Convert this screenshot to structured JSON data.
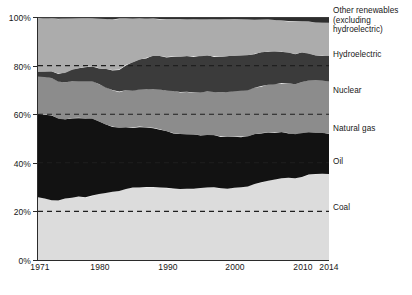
{
  "chart_data": {
    "type": "area",
    "title": "",
    "subtitle": "",
    "xlabel": "",
    "ylabel": "",
    "stacked": true,
    "normalized": true,
    "grid": true,
    "grid_style": "dashed-horizontal",
    "legend_position": "right",
    "xlim": [
      1971,
      2014
    ],
    "ylim": [
      0,
      100
    ],
    "y_ticks": [
      "0%",
      "20%",
      "40%",
      "60%",
      "80%",
      "100%"
    ],
    "y_tick_values": [
      0,
      20,
      40,
      60,
      80,
      100
    ],
    "x_ticks": [
      "1971",
      "1980",
      "1990",
      "2000",
      "2010",
      "2014"
    ],
    "x_tick_values": [
      1971,
      1980,
      1990,
      2000,
      2010,
      2014
    ],
    "x": [
      1971,
      1972,
      1973,
      1974,
      1975,
      1976,
      1977,
      1978,
      1979,
      1980,
      1981,
      1982,
      1983,
      1984,
      1985,
      1986,
      1987,
      1988,
      1989,
      1990,
      1991,
      1992,
      1993,
      1994,
      1995,
      1996,
      1997,
      1998,
      1999,
      2000,
      2001,
      2002,
      2003,
      2004,
      2005,
      2006,
      2007,
      2008,
      2009,
      2010,
      2011,
      2012,
      2013,
      2014
    ],
    "series": [
      {
        "name": "Coal",
        "color": "#DCDCDC",
        "order": 1,
        "values": [
          25.8,
          25.3,
          24.6,
          24.5,
          25.3,
          25.6,
          26.1,
          25.8,
          26.5,
          27.2,
          27.6,
          28.1,
          28.4,
          29.2,
          29.8,
          29.8,
          30.0,
          30.0,
          29.8,
          29.7,
          29.4,
          29.2,
          29.3,
          29.3,
          29.6,
          29.8,
          29.9,
          29.5,
          29.3,
          29.7,
          29.9,
          30.2,
          31.3,
          32.0,
          32.6,
          33.1,
          33.6,
          33.8,
          33.6,
          34.2,
          35.2,
          35.4,
          35.5,
          35.4
        ]
      },
      {
        "name": "Oil",
        "color": "#121212",
        "order": 2,
        "values": [
          34.4,
          34.6,
          35.0,
          33.6,
          32.5,
          32.8,
          32.4,
          32.5,
          31.6,
          29.8,
          28.2,
          26.8,
          26.0,
          25.4,
          24.7,
          25.1,
          24.6,
          24.4,
          24.0,
          23.3,
          22.9,
          22.7,
          22.4,
          22.2,
          21.8,
          21.6,
          21.4,
          21.4,
          21.5,
          21.1,
          20.9,
          20.6,
          20.4,
          20.3,
          19.9,
          19.4,
          19.0,
          18.5,
          18.2,
          18.0,
          17.5,
          17.1,
          16.8,
          16.6
        ]
      },
      {
        "name": "Natural gas",
        "color": "#8C8C8C",
        "order": 3,
        "values": [
          15.2,
          15.4,
          15.3,
          15.4,
          15.2,
          15.3,
          15.1,
          15.3,
          15.5,
          15.4,
          15.2,
          15.1,
          14.9,
          15.3,
          15.2,
          15.3,
          15.7,
          16.0,
          16.4,
          16.7,
          17.2,
          17.2,
          17.5,
          17.4,
          17.5,
          17.9,
          17.8,
          18.0,
          18.3,
          18.6,
          18.8,
          19.1,
          19.2,
          19.3,
          19.6,
          19.8,
          20.2,
          20.4,
          20.5,
          21.0,
          21.2,
          21.4,
          21.5,
          21.6
        ]
      },
      {
        "name": "Nuclear",
        "color": "#3B3B3B",
        "order": 4,
        "values": [
          2.1,
          2.4,
          2.7,
          3.2,
          4.0,
          4.5,
          5.3,
          5.9,
          6.1,
          6.6,
          7.6,
          8.2,
          9.1,
          10.4,
          11.6,
          12.2,
          12.9,
          13.6,
          13.7,
          13.8,
          14.3,
          14.5,
          14.6,
          14.9,
          14.9,
          14.8,
          14.7,
          14.7,
          14.8,
          14.6,
          14.5,
          14.4,
          14.0,
          13.8,
          13.7,
          13.4,
          12.9,
          12.6,
          12.5,
          12.2,
          11.0,
          10.3,
          10.3,
          10.4
        ]
      },
      {
        "name": "Hydroelectric",
        "color": "#ACACAC",
        "order": 5,
        "values": [
          22.0,
          21.8,
          21.9,
          22.6,
          22.4,
          21.2,
          20.5,
          20.0,
          19.7,
          20.3,
          20.6,
          20.8,
          21.0,
          19.1,
          18.1,
          17.0,
          16.2,
          15.4,
          15.3,
          15.7,
          15.4,
          15.6,
          15.3,
          15.3,
          15.3,
          15.0,
          15.2,
          15.4,
          15.2,
          15.1,
          14.9,
          14.7,
          14.0,
          13.6,
          13.2,
          13.1,
          12.9,
          13.1,
          13.4,
          12.9,
          13.2,
          13.5,
          13.5,
          13.6
        ]
      },
      {
        "name": "Other renewables (excluding hydroelectric)",
        "color": "#2E2E2E",
        "order": 6,
        "values": [
          0.5,
          0.5,
          0.5,
          0.7,
          0.6,
          0.6,
          0.6,
          0.5,
          0.6,
          0.7,
          0.8,
          1.0,
          0.6,
          0.6,
          0.6,
          0.6,
          0.6,
          0.6,
          0.8,
          0.8,
          0.8,
          0.8,
          0.9,
          0.9,
          0.9,
          0.9,
          1.0,
          1.0,
          0.9,
          0.9,
          1.0,
          1.0,
          1.1,
          1.0,
          1.0,
          1.2,
          1.4,
          1.6,
          1.8,
          1.7,
          1.9,
          2.3,
          2.4,
          2.4
        ]
      }
    ],
    "legend_entries": [
      {
        "label": "Other renewables (excluding hydroelectric)",
        "color": "#2E2E2E"
      },
      {
        "label": "Hydroelectric",
        "color": "#ACACAC"
      },
      {
        "label": "Nuclear",
        "color": "#3B3B3B"
      },
      {
        "label": "Natural gas",
        "color": "#8C8C8C"
      },
      {
        "label": "Oil",
        "color": "#121212"
      },
      {
        "label": "Coal",
        "color": "#DCDCDC"
      }
    ]
  },
  "axis": {
    "y_labels": [
      "100%",
      "80%",
      "60%",
      "40%",
      "20%",
      "0%"
    ],
    "x_labels": [
      "1971",
      "1980",
      "1990",
      "2000",
      "2010",
      "2014"
    ]
  },
  "colors": {
    "axis": "#2b2b2b",
    "gridline": "#1f1f1f",
    "background": "#ffffff",
    "text": "#171717"
  }
}
